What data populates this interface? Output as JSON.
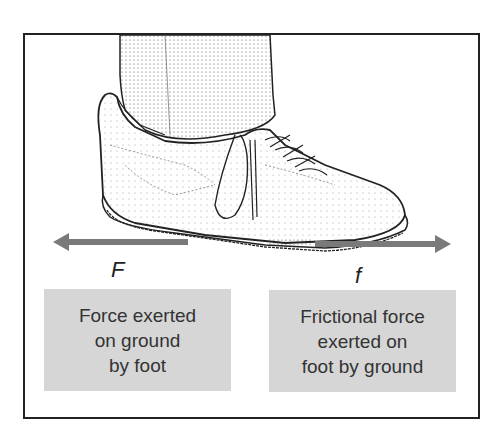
{
  "figure": {
    "left_force": {
      "symbol": "F",
      "direction": "left",
      "caption_lines": [
        "Force exerted",
        "on ground",
        "by foot"
      ]
    },
    "right_force": {
      "symbol": "f",
      "direction": "right",
      "caption_lines": [
        "Frictional force",
        "exerted on",
        "foot by ground"
      ]
    },
    "colors": {
      "arrow": "#7a7a7a",
      "caption_box": "#d6d6d6",
      "frame": "#222222",
      "text": "#333333"
    }
  }
}
